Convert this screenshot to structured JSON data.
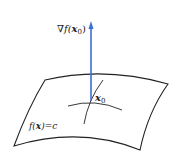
{
  "diagram": {
    "gradient_label": "∇f(x₀)",
    "gradient_label_parts": {
      "nabla_f": "∇f(",
      "x": "x",
      "sub": "0",
      "close": ")"
    },
    "point_label": {
      "x": "x",
      "sub": "0"
    },
    "surface_label": {
      "f": "f(",
      "x": "x",
      "rest": ")=c"
    },
    "colors": {
      "arrow": "#3b6fd1",
      "lines": "#222222",
      "background": "#ffffff"
    }
  }
}
